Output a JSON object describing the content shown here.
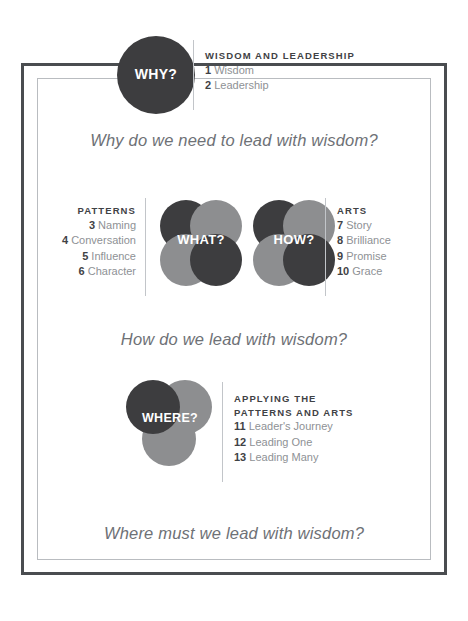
{
  "frame": {
    "outer_color": "#4a4d50",
    "inner_color": "#b9bcc0"
  },
  "palette": {
    "dark_circle": "#3d3d3f",
    "light_circle": "#8d8e90",
    "overlap": "#2c2c2e",
    "heading_text": "#3f4245",
    "item_text": "#8e9195",
    "question_text": "#6e7176",
    "divider": "#c2c5c9"
  },
  "sections": {
    "why": {
      "icon_label": "WHY?",
      "heading": "WISDOM AND LEADERSHIP",
      "items": [
        {
          "num": "1",
          "label": "Wisdom"
        },
        {
          "num": "2",
          "label": "Leadership"
        }
      ]
    },
    "patterns": {
      "heading": "PATTERNS",
      "items": [
        {
          "num": "3",
          "label": "Naming"
        },
        {
          "num": "4",
          "label": "Conversation"
        },
        {
          "num": "5",
          "label": "Influence"
        },
        {
          "num": "6",
          "label": "Character"
        }
      ]
    },
    "what": {
      "icon_label": "WHAT?"
    },
    "how": {
      "icon_label": "HOW?"
    },
    "arts": {
      "heading": "ARTS",
      "items": [
        {
          "num": "7",
          "label": "Story"
        },
        {
          "num": "8",
          "label": "Brilliance"
        },
        {
          "num": "9",
          "label": "Promise"
        },
        {
          "num": "10",
          "label": "Grace"
        }
      ]
    },
    "where": {
      "icon_label": "WHERE?",
      "heading_line1": "APPLYING THE",
      "heading_line2": "PATTERNS AND ARTS",
      "items": [
        {
          "num": "11",
          "label": "Leader's Journey"
        },
        {
          "num": "12",
          "label": "Leading One"
        },
        {
          "num": "13",
          "label": "Leading Many"
        }
      ]
    }
  },
  "questions": {
    "q1": "Why do we need to lead with wisdom?",
    "q2": "How do we lead with wisdom?",
    "q3": "Where must we lead with wisdom?"
  }
}
